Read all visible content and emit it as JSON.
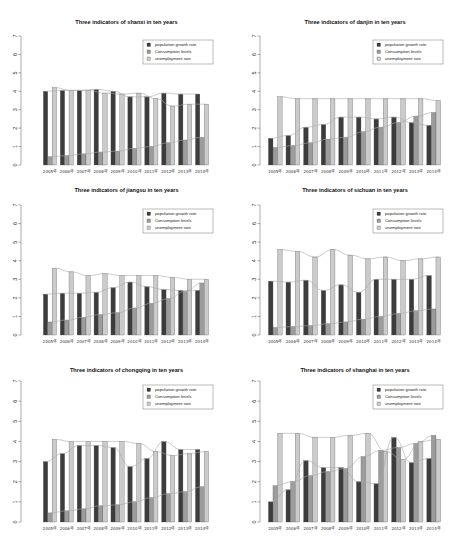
{
  "colors": {
    "population": "#3c3c3c",
    "consumption": "#9c9c9c",
    "unemployment": "#cbcbcb",
    "line": "#a8a8a8",
    "bar_stroke": "#555555"
  },
  "legend": [
    "population growth rate",
    "Consumption levels",
    "unemployment rate"
  ],
  "chart_data": [
    {
      "type": "bar",
      "title": "Three indicators of shanxi in ten years",
      "categories": [
        "2005年",
        "2006年",
        "2007年",
        "2008年",
        "2009年",
        "2010年",
        "2011年",
        "2012年",
        "2013年",
        "2014年"
      ],
      "ylim": [
        0,
        7
      ],
      "yticks": [
        0,
        1,
        2,
        3,
        4,
        5,
        6,
        7
      ],
      "xlabel": "",
      "ylabel": "",
      "legend_position": "top-right",
      "grid": false,
      "series": [
        {
          "name": "population growth rate",
          "values": [
            4.0,
            4.05,
            4.05,
            4.1,
            4.0,
            3.7,
            3.7,
            3.9,
            3.85,
            3.85
          ]
        },
        {
          "name": "Consumption levels",
          "values": [
            0.45,
            0.5,
            0.6,
            0.7,
            0.75,
            0.9,
            1.0,
            1.2,
            1.35,
            1.5
          ]
        },
        {
          "name": "unemployment rate",
          "values": [
            4.2,
            4.05,
            4.05,
            3.9,
            3.85,
            3.9,
            3.6,
            3.2,
            3.3,
            3.3
          ]
        }
      ]
    },
    {
      "type": "bar",
      "title": "Three indicators of danjin in ten years",
      "categories": [
        "2005年",
        "2006年",
        "2007年",
        "2008年",
        "2009年",
        "2010年",
        "2011年",
        "2012年",
        "2013年",
        "2014年"
      ],
      "ylim": [
        0,
        7
      ],
      "yticks": [
        0,
        1,
        2,
        3,
        4,
        5,
        6,
        7
      ],
      "xlabel": "",
      "ylabel": "",
      "legend_position": "top-right",
      "grid": false,
      "series": [
        {
          "name": "population growth rate",
          "values": [
            1.45,
            1.6,
            2.05,
            2.2,
            2.6,
            2.6,
            2.5,
            2.6,
            2.3,
            2.15
          ]
        },
        {
          "name": "Consumption levels",
          "values": [
            0.95,
            1.05,
            1.2,
            1.4,
            1.5,
            1.8,
            2.05,
            2.3,
            2.65,
            2.85
          ]
        },
        {
          "name": "unemployment rate",
          "values": [
            3.7,
            3.6,
            3.6,
            3.6,
            3.6,
            3.6,
            3.6,
            3.6,
            3.6,
            3.5
          ]
        }
      ]
    },
    {
      "type": "bar",
      "title": "Three indicators of jiangsu in ten years",
      "categories": [
        "2005年",
        "2006年",
        "2007年",
        "2008年",
        "2009年",
        "2010年",
        "2011年",
        "2012年",
        "2013年",
        "2014年"
      ],
      "ylim": [
        0,
        7
      ],
      "yticks": [
        0,
        1,
        2,
        3,
        4,
        5,
        6,
        7
      ],
      "xlabel": "",
      "ylabel": "",
      "legend_position": "top-right",
      "grid": false,
      "series": [
        {
          "name": "population growth rate",
          "values": [
            2.2,
            2.25,
            2.25,
            2.3,
            2.55,
            2.85,
            2.6,
            2.45,
            2.4,
            2.4
          ]
        },
        {
          "name": "Consumption levels",
          "values": [
            0.7,
            0.8,
            0.95,
            1.1,
            1.2,
            1.45,
            1.7,
            1.95,
            2.35,
            2.8
          ]
        },
        {
          "name": "unemployment rate",
          "values": [
            3.6,
            3.4,
            3.2,
            3.3,
            3.2,
            3.2,
            3.2,
            3.1,
            3.0,
            3.0
          ]
        }
      ]
    },
    {
      "type": "bar",
      "title": "Three indicators of sichuan in ten years",
      "categories": [
        "2005年",
        "2006年",
        "2007年",
        "2008年",
        "2009年",
        "2010年",
        "2011年",
        "2012年",
        "2013年",
        "2014年"
      ],
      "ylim": [
        0,
        7
      ],
      "yticks": [
        0,
        1,
        2,
        3,
        4,
        5,
        6,
        7
      ],
      "xlabel": "",
      "ylabel": "",
      "legend_position": "top-right",
      "grid": false,
      "series": [
        {
          "name": "population growth rate",
          "values": [
            2.9,
            2.85,
            2.95,
            2.4,
            2.7,
            2.3,
            3.0,
            3.0,
            3.0,
            3.2
          ]
        },
        {
          "name": "Consumption levels",
          "values": [
            0.4,
            0.45,
            0.5,
            0.6,
            0.7,
            0.85,
            1.0,
            1.15,
            1.3,
            1.4
          ]
        },
        {
          "name": "unemployment rate",
          "values": [
            4.6,
            4.5,
            4.2,
            4.6,
            4.3,
            4.1,
            4.2,
            4.0,
            4.1,
            4.2
          ]
        }
      ]
    },
    {
      "type": "bar",
      "title": "Three indicators of chongqing in ten years",
      "categories": [
        "2005年",
        "2006年",
        "2007年",
        "2008年",
        "2009年",
        "2010年",
        "2011年",
        "2012年",
        "2013年",
        "2014年"
      ],
      "ylim": [
        0,
        7
      ],
      "yticks": [
        0,
        1,
        2,
        3,
        4,
        5,
        6,
        7
      ],
      "xlabel": "",
      "ylabel": "",
      "legend_position": "top-right",
      "grid": false,
      "series": [
        {
          "name": "population growth rate",
          "values": [
            3.0,
            3.4,
            3.8,
            3.8,
            3.7,
            2.75,
            3.15,
            4.0,
            3.6,
            3.6
          ]
        },
        {
          "name": "Consumption levels",
          "values": [
            0.45,
            0.55,
            0.65,
            0.8,
            0.85,
            1.0,
            1.2,
            1.4,
            1.5,
            1.75
          ]
        },
        {
          "name": "unemployment rate",
          "values": [
            4.1,
            4.0,
            4.0,
            4.0,
            4.0,
            3.9,
            3.5,
            3.3,
            3.4,
            3.5
          ]
        }
      ]
    },
    {
      "type": "bar",
      "title": "Three indicators of shanghai in ten years",
      "categories": [
        "2005年",
        "2006年",
        "2007年",
        "2008年",
        "2009年",
        "2010年",
        "2011年",
        "2012年",
        "2013年",
        "2014年"
      ],
      "ylim": [
        0,
        7
      ],
      "yticks": [
        0,
        1,
        2,
        3,
        4,
        5,
        6,
        7
      ],
      "xlabel": "",
      "ylabel": "",
      "legend_position": "top-right",
      "grid": false,
      "series": [
        {
          "name": "population growth rate",
          "values": [
            1.0,
            1.6,
            3.05,
            2.7,
            2.7,
            2.0,
            1.9,
            4.2,
            2.95,
            3.15
          ]
        },
        {
          "name": "Consumption levels",
          "values": [
            1.8,
            2.0,
            2.3,
            2.5,
            2.65,
            3.25,
            3.55,
            3.7,
            3.9,
            4.3
          ]
        },
        {
          "name": "unemployment rate",
          "values": [
            4.4,
            4.4,
            4.2,
            4.2,
            4.3,
            4.4,
            3.5,
            3.1,
            4.0,
            4.1
          ]
        }
      ]
    }
  ]
}
